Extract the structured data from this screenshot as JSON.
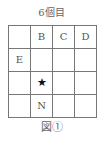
{
  "title": "6個目",
  "grid": {
    "rows": [
      [
        "",
        "B",
        "C",
        "D"
      ],
      [
        "E",
        "",
        "",
        ""
      ],
      [
        "",
        "★",
        "",
        ""
      ],
      [
        "",
        "N",
        "",
        ""
      ]
    ],
    "star_position": {
      "row": 2,
      "col": 1
    }
  },
  "caption": "図①"
}
